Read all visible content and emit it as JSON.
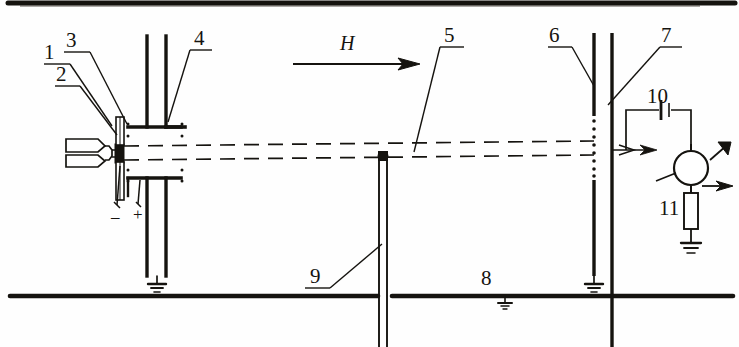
{
  "figure": {
    "type": "technical-line-diagram",
    "canvas": {
      "width": 739,
      "height": 347
    },
    "ink_color": "#15130f",
    "background_color": "#fefefe"
  },
  "labels": {
    "n1": "1",
    "n2": "2",
    "n3": "3",
    "n4": "4",
    "n5": "5",
    "n6": "6",
    "n7": "7",
    "n8": "8",
    "n9": "9",
    "n10": "10",
    "n11": "11",
    "field": "H",
    "minus": "–",
    "plus": "+"
  },
  "components": [
    {
      "id": "1",
      "name": "beam-source-oven",
      "label": "1"
    },
    {
      "id": "2",
      "name": "source-aperture",
      "label": "2"
    },
    {
      "id": "3",
      "name": "collimating-slit-plate",
      "label": "3"
    },
    {
      "id": "4",
      "name": "deflector-electrode-assembly",
      "label": "4"
    },
    {
      "id": "5",
      "name": "molecular-beam-path",
      "label": "5"
    },
    {
      "id": "6",
      "name": "detector-grid-wire",
      "label": "6"
    },
    {
      "id": "7",
      "name": "collector-plate",
      "label": "7"
    },
    {
      "id": "8",
      "name": "baseline-rail",
      "label": "8"
    },
    {
      "id": "9",
      "name": "support-post",
      "label": "9"
    },
    {
      "id": "10",
      "name": "battery-cell",
      "label": "10"
    },
    {
      "id": "11",
      "name": "resistor",
      "label": "11"
    }
  ],
  "annotations": {
    "field_arrow": "H",
    "polarity_negative": "–",
    "polarity_positive": "+"
  }
}
